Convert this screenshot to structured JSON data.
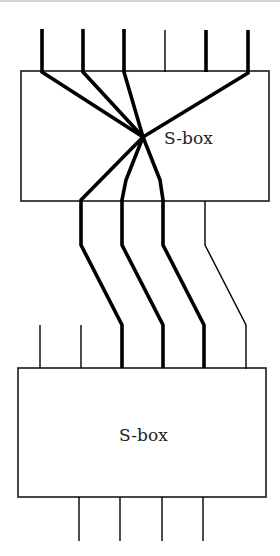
{
  "diagram": {
    "colors": {
      "stroke": "#000000",
      "box_border": "#1a1a1a",
      "text": "#222222",
      "background": "#ffffff"
    },
    "boxes": [
      {
        "id": "sbox-1",
        "label": "S-box",
        "x": 21,
        "y": 71,
        "w": 248,
        "h": 130,
        "label_x": 164,
        "label_y": 144
      },
      {
        "id": "sbox-2",
        "label": "S-box",
        "x": 18,
        "y": 368,
        "w": 248,
        "h": 129,
        "label_x": 119,
        "label_y": 441
      }
    ],
    "wires": [
      {
        "id": "in-1",
        "thick": true,
        "points": "42,29 42,72 143,137"
      },
      {
        "id": "in-2",
        "thick": true,
        "points": "83,29 83,72 143,137"
      },
      {
        "id": "in-3",
        "thick": true,
        "points": "124,29 124,72 143,137"
      },
      {
        "id": "in-4",
        "thick": false,
        "points": "165,30 165,72"
      },
      {
        "id": "in-5",
        "thick": true,
        "points": "206,30 206,72"
      },
      {
        "id": "in-6",
        "thick": true,
        "points": "248,30 248,73 143,137"
      },
      {
        "id": "mid-1",
        "thick": true,
        "points": "143,137 81,200 81,245 122,325 122,368"
      },
      {
        "id": "mid-2",
        "thick": true,
        "points": "143,137 126,180 122,200 122,245 163,325 163,368"
      },
      {
        "id": "mid-3",
        "thick": true,
        "points": "143,137 160,180 163,200 163,245 204,325 204,368"
      },
      {
        "id": "mid-4",
        "thick": false,
        "points": "205,201 205,245 246,325 246,369"
      },
      {
        "id": "pass-1",
        "thick": false,
        "points": "40,325 40,368"
      },
      {
        "id": "pass-2",
        "thick": false,
        "points": "81,325 81,368"
      },
      {
        "id": "out-1",
        "thick": false,
        "points": "79,497 79,541"
      },
      {
        "id": "out-2",
        "thick": false,
        "points": "120,497 120,541"
      },
      {
        "id": "out-3",
        "thick": false,
        "points": "162,497 162,541"
      },
      {
        "id": "out-4",
        "thick": false,
        "points": "203,497 203,541"
      }
    ],
    "thick_width": 3.6,
    "thin_width": 1.4
  }
}
